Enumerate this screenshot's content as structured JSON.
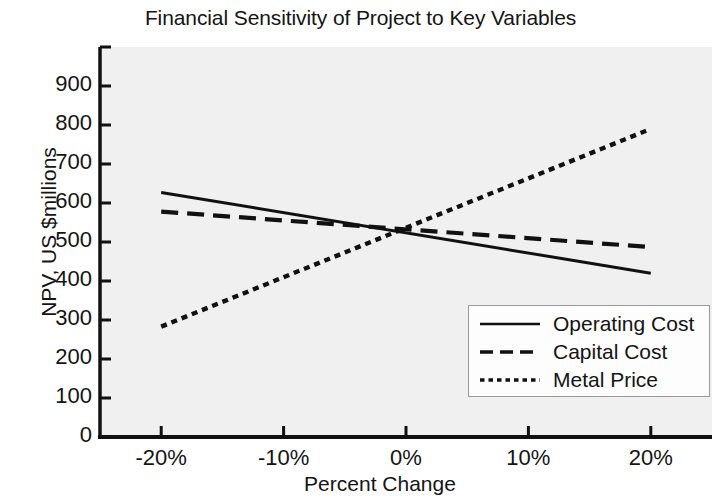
{
  "chart_data": {
    "type": "line",
    "title": "Financial Sensitivity of Project to Key Variables",
    "xlabel": "Percent Change",
    "ylabel": "NPV, US $millions",
    "xlim": [
      -25,
      25
    ],
    "ylim": [
      0,
      1000
    ],
    "x_tick_labels": [
      "-20%",
      "-10%",
      "0%",
      "10%",
      "20%"
    ],
    "x_tick_values": [
      -20,
      -10,
      0,
      10,
      20
    ],
    "y_tick_labels": [
      "0",
      "100",
      "200",
      "300",
      "400",
      "500",
      "600",
      "700",
      "800",
      "900"
    ],
    "y_tick_values": [
      0,
      100,
      200,
      300,
      400,
      500,
      600,
      700,
      800,
      900
    ],
    "grid": false,
    "legend_position": "lower right",
    "x": [
      -20,
      20
    ],
    "series": [
      {
        "name": "Operating Cost",
        "style": "solid",
        "color": "#111111",
        "values": [
          627,
          420
        ]
      },
      {
        "name": "Capital Cost",
        "style": "dashed",
        "color": "#111111",
        "values": [
          578,
          487
        ]
      },
      {
        "name": "Metal Price",
        "style": "dotted",
        "color": "#111111",
        "values": [
          283,
          790
        ]
      }
    ],
    "crossing_point": {
      "x": 0,
      "y": 520
    }
  },
  "legend": {
    "items": [
      {
        "label": "Operating Cost",
        "style": "solid"
      },
      {
        "label": "Capital Cost",
        "style": "dashed"
      },
      {
        "label": "Metal Price",
        "style": "dotted"
      }
    ]
  }
}
